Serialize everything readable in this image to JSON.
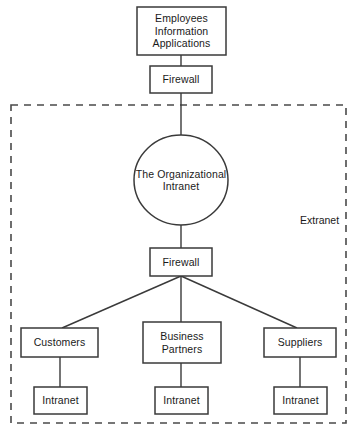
{
  "diagram": {
    "title_text": "",
    "colors": {
      "background": "#ffffff",
      "stroke": "#3a3a3a",
      "text": "#1a1a1a",
      "dashed_border": "#4a4a4a"
    },
    "zone": {
      "label": "Extranet",
      "style": "dashed"
    },
    "nodes": {
      "employees_information_applications": {
        "label": "Employees\nInformation\nApplications",
        "shape": "rectangle"
      },
      "firewall_top": {
        "label": "Firewall",
        "shape": "rectangle"
      },
      "organizational_intranet": {
        "label": "The Organizational\nIntranet",
        "shape": "circle"
      },
      "firewall_bottom": {
        "label": "Firewall",
        "shape": "rectangle"
      },
      "customers": {
        "label": "Customers",
        "shape": "rectangle"
      },
      "business_partners": {
        "label": "Business\nPartners",
        "shape": "rectangle"
      },
      "suppliers": {
        "label": "Suppliers",
        "shape": "rectangle"
      },
      "intranet_customers": {
        "label": "Intranet",
        "shape": "rectangle"
      },
      "intranet_business_partners": {
        "label": "Intranet",
        "shape": "rectangle"
      },
      "intranet_suppliers": {
        "label": "Intranet",
        "shape": "rectangle"
      }
    }
  }
}
